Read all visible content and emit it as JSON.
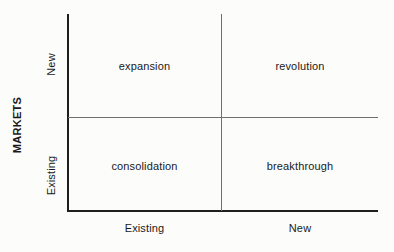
{
  "chart_data": {
    "type": "table",
    "title": "",
    "xlabel": "",
    "ylabel": "MARKETS",
    "x_categories": [
      "Existing",
      "New"
    ],
    "y_categories": [
      "Existing",
      "New"
    ],
    "grid": true,
    "legend": "none",
    "cells": [
      {
        "row": "New",
        "column": "Existing",
        "label": "expansion"
      },
      {
        "row": "New",
        "column": "New",
        "label": "revolution"
      },
      {
        "row": "Existing",
        "column": "Existing",
        "label": "consolidation"
      },
      {
        "row": "Existing",
        "column": "New",
        "label": "breakthrough"
      }
    ],
    "colors": {
      "axis": "#1e1e1e",
      "divider": "#6f6f6f",
      "text": "#1a1a1a",
      "background": "#fcfcfa"
    }
  },
  "matrix": {
    "axis_title_y": "MARKETS",
    "y_labels": {
      "top": "New",
      "bottom": "Existing"
    },
    "x_labels": {
      "left": "Existing",
      "right": "New"
    },
    "quadrants": {
      "top_left": "expansion",
      "top_right": "revolution",
      "bottom_left": "consolidation",
      "bottom_right": "breakthrough"
    }
  }
}
